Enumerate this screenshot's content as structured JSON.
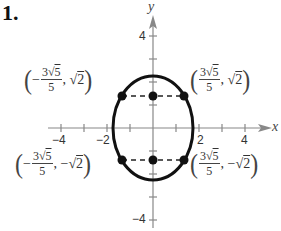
{
  "problem_number": "1.",
  "axes": {
    "x_label": "x",
    "y_label": "y",
    "x_ticks": [
      {
        "value": -4,
        "label": "−4"
      },
      {
        "value": -2,
        "label": "−2"
      },
      {
        "value": 2,
        "label": "2"
      },
      {
        "value": 4,
        "label": "4"
      }
    ],
    "y_ticks": [
      {
        "value": 4,
        "label": "4"
      },
      {
        "value": -4,
        "label": "−4"
      }
    ],
    "range": {
      "xmin": -4.5,
      "xmax": 5,
      "ymin": -4.5,
      "ymax": 5
    }
  },
  "curve": {
    "type": "ellipse",
    "equation": "x^2/3 + y^2/5 = 1",
    "a": 1.732,
    "b": 2.236,
    "color": "#111111"
  },
  "points": [
    {
      "x": -1.342,
      "y": 1.414,
      "label": {
        "sign": "−",
        "num": "3√5",
        "num_coef": "3",
        "num_rad": "5",
        "den": "5",
        "y": "√2"
      }
    },
    {
      "x": 1.342,
      "y": 1.414,
      "label": {
        "sign": "",
        "num_coef": "3",
        "num_rad": "5",
        "den": "5",
        "y": "√2"
      }
    },
    {
      "x": -1.342,
      "y": -1.414,
      "label": {
        "sign": "−",
        "num_coef": "3",
        "num_rad": "5",
        "den": "5",
        "y": "−√2"
      }
    },
    {
      "x": 1.342,
      "y": -1.414,
      "label": {
        "sign": "",
        "num_coef": "3",
        "num_rad": "5",
        "den": "5",
        "y": "−√2"
      }
    },
    {
      "x": 0,
      "y": 1.414
    },
    {
      "x": 0,
      "y": -1.414
    }
  ],
  "labels": {
    "tl": {
      "open": "(",
      "sign": "−",
      "coef": "3",
      "rad": "5",
      "den": "5",
      "comma": ",",
      "yval_sign": "",
      "yval_rad": "2",
      "close": ")"
    },
    "tr": {
      "open": "(",
      "sign": "",
      "coef": "3",
      "rad": "5",
      "den": "5",
      "comma": ",",
      "yval_sign": "",
      "yval_rad": "2",
      "close": ")"
    },
    "bl": {
      "open": "(",
      "sign": "−",
      "coef": "3",
      "rad": "5",
      "den": "5",
      "comma": ",",
      "yval_sign": "−",
      "yval_rad": "2",
      "close": ")"
    },
    "br": {
      "open": "(",
      "sign": "",
      "coef": "3",
      "rad": "5",
      "den": "5",
      "comma": ",",
      "yval_sign": "−",
      "yval_rad": "2",
      "close": ")"
    }
  },
  "radical_symbol": "√"
}
